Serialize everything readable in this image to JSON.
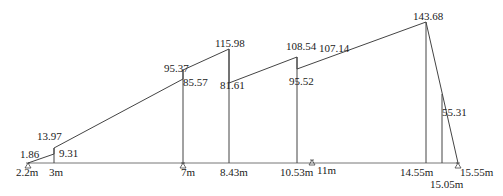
{
  "diagram": {
    "type": "beam-moment-diagram",
    "baseline": {
      "x_start_m": 2.2,
      "x_end_m": 15.55
    },
    "x_labels": [
      {
        "pos_m": 2.2,
        "label": "2.2m"
      },
      {
        "pos_m": 3,
        "label": "3m"
      },
      {
        "pos_m": 7,
        "label": "7m"
      },
      {
        "pos_m": 8.43,
        "label": "8.43m"
      },
      {
        "pos_m": 10.53,
        "label": "10.53m"
      },
      {
        "pos_m": 11,
        "label": "11m"
      },
      {
        "pos_m": 14.55,
        "label": "14.55m"
      },
      {
        "pos_m": 15.05,
        "label": "15.05m"
      },
      {
        "pos_m": 15.55,
        "label": "15.55m"
      }
    ],
    "supports": [
      2.2,
      7,
      11,
      15.55
    ],
    "values": [
      {
        "pos_m": 2.2,
        "value": 0
      },
      {
        "pos_m": 3,
        "left": 1.86,
        "right": 9.31
      },
      {
        "pos_m": 3,
        "top_label": 13.97
      },
      {
        "pos_m": 7,
        "left": 85.57,
        "right": 95.37
      },
      {
        "pos_m": 8.43,
        "left": 115.98,
        "right": 81.61
      },
      {
        "pos_m": 10.53,
        "left": 108.54,
        "right": 95.52
      },
      {
        "pos_m": 10.53,
        "segment_label": 107.14
      },
      {
        "pos_m": 14.55,
        "value": 143.68
      },
      {
        "pos_m": 15.05,
        "value": 55.31
      },
      {
        "pos_m": 15.55,
        "value": 0
      }
    ],
    "value_labels": {
      "v1_86": "1.86",
      "v13_97": "13.97",
      "v9_31": "9.31",
      "v95_37": "95.37",
      "v85_57": "85.57",
      "v115_98": "115.98",
      "v81_61": "81.61",
      "v108_54": "108.54",
      "v107_14": "107.14",
      "v95_52": "95.52",
      "v143_68": "143.68",
      "v55_31": "55.31"
    },
    "x_label_text": {
      "x2_2": "2.2m",
      "x3": "3m",
      "x7": "7m",
      "x8_43": "8.43m",
      "x10_53": "10.53m",
      "x11": "11m",
      "x14_55": "14.55m",
      "x15_05": "15.05m",
      "x15_55": "15.55m"
    },
    "colors": {
      "line": "#444444",
      "baseline": "#777777",
      "text": "#1a1a1a",
      "background": "#ffffff"
    }
  }
}
